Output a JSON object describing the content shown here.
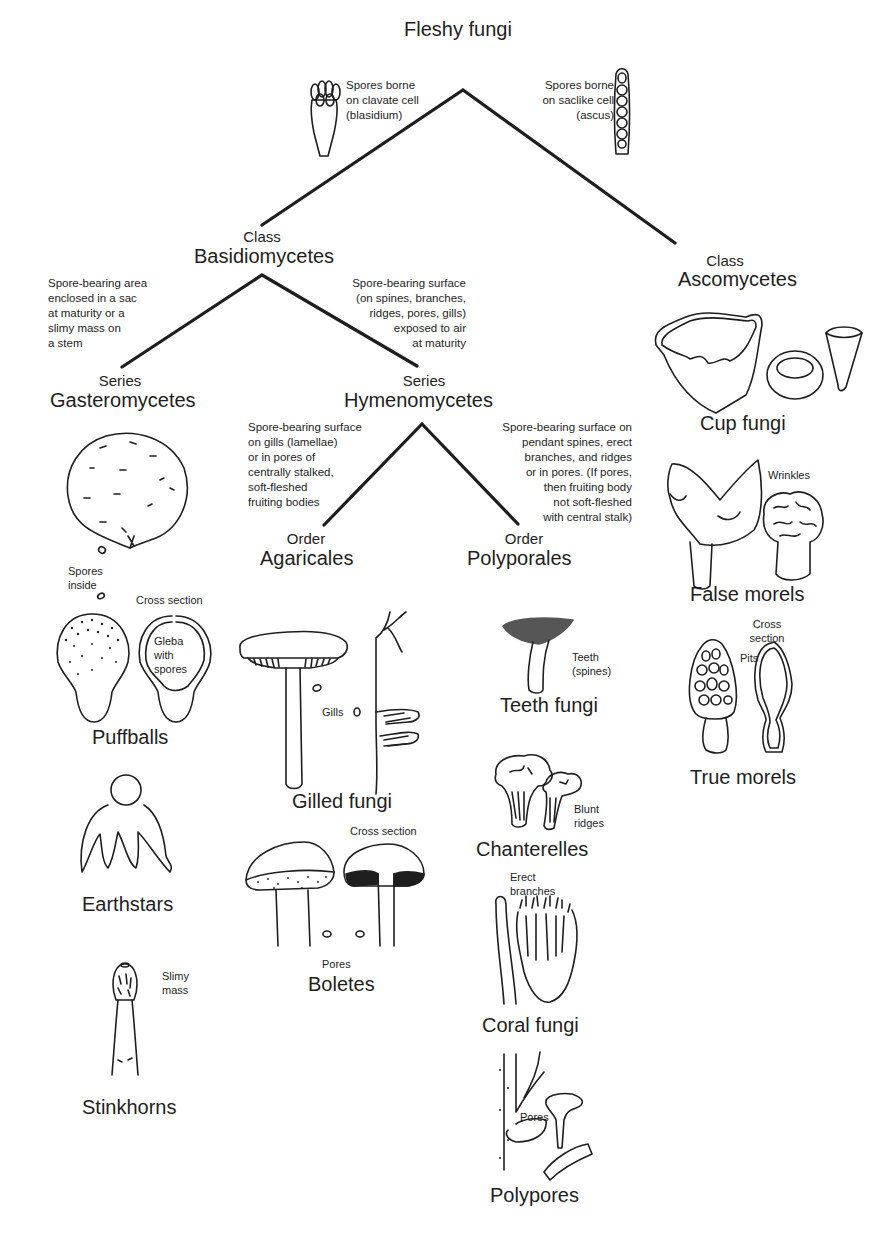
{
  "title": "Fleshy fungi",
  "root_notes": {
    "left": "Spores borne\non clavate cell\n(blasidium)",
    "right": "Spores borne\non saclike cell\n(ascus)"
  },
  "basidiomycetes": {
    "rank": "Class",
    "name": "Basidiomycetes",
    "note_left": "Spore-bearing area\nenclosed in a sac\nat maturity or a\nslimy mass on\na stem",
    "note_right": "Spore-bearing surface\n(on spines, branches,\nridges, pores, gills)\nexposed to air\nat maturity"
  },
  "ascomycetes": {
    "rank": "Class",
    "name": "Ascomycetes",
    "groups": [
      {
        "name": "Cup fungi",
        "labels": []
      },
      {
        "name": "False morels",
        "labels": [
          "Wrinkles"
        ]
      },
      {
        "name": "True morels",
        "labels": [
          "Pits",
          "Cross\nsection"
        ]
      }
    ]
  },
  "gasteromycetes": {
    "rank": "Series",
    "name": "Gasteromycetes",
    "groups": [
      {
        "name": "Puffballs",
        "labels": [
          "Spores\ninside",
          "Cross section",
          "Gleba\nwith\nspores"
        ]
      },
      {
        "name": "Earthstars",
        "labels": []
      },
      {
        "name": "Stinkhorns",
        "labels": [
          "Slimy\nmass"
        ]
      }
    ]
  },
  "hymenomycetes": {
    "rank": "Series",
    "name": "Hymenomycetes",
    "note_left": "Spore-bearing surface\non gills (lamellae)\nor in pores of\ncentrally stalked,\nsoft-fleshed\nfruiting bodies",
    "note_right": "Spore-bearing surface on\npendant spines, erect\nbranches, and ridges\nor in pores. (If pores,\nthen fruiting body\nnot soft-fleshed\nwith central stalk)"
  },
  "agaricales": {
    "rank": "Order",
    "name": "Agaricales",
    "groups": [
      {
        "name": "Gilled fungi",
        "labels": [
          "Gills"
        ]
      },
      {
        "name": "Boletes",
        "labels": [
          "Cross section",
          "Pores"
        ]
      }
    ]
  },
  "polyporales": {
    "rank": "Order",
    "name": "Polyporales",
    "groups": [
      {
        "name": "Teeth\nfungi",
        "labels": [
          "Teeth\n(spines)"
        ]
      },
      {
        "name": "Chanterelles",
        "labels": [
          "Blunt\nridges"
        ]
      },
      {
        "name": "Coral fungi",
        "labels": [
          "Erect\nbranches"
        ]
      },
      {
        "name": "Polypores",
        "labels": [
          "Pores"
        ]
      }
    ]
  },
  "colors": {
    "ink": "#1e1e1e",
    "background": "#ffffff"
  }
}
